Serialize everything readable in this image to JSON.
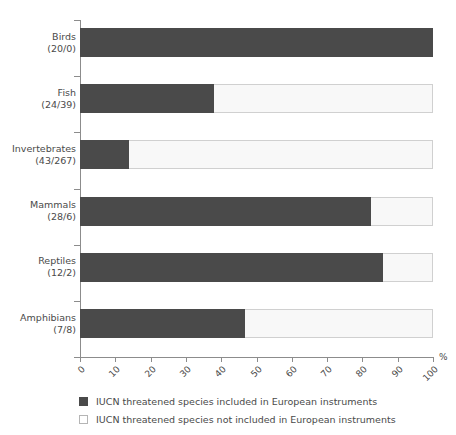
{
  "chart_data": {
    "type": "bar",
    "orientation": "horizontal",
    "stacked": true,
    "stack_mode": "percent",
    "title": "",
    "xlabel": "%",
    "ylabel": "",
    "xlim": [
      0,
      100
    ],
    "xticks": [
      "0",
      "10",
      "20",
      "30",
      "40",
      "50",
      "60",
      "70",
      "80",
      "90",
      "100"
    ],
    "grid": false,
    "legend_position": "bottom",
    "categories": [
      "Birds\n(20/0)",
      "Fish\n(24/39)",
      "Invertebrates\n(43/267)",
      "Mammals\n(28/6)",
      "Reptiles\n(12/2)",
      "Amphibians\n(7/8)"
    ],
    "category_names": [
      "Birds",
      "Fish",
      "Invertebrates",
      "Mammals",
      "Reptiles",
      "Amphibians"
    ],
    "category_counts": [
      "(20/0)",
      "(24/39)",
      "(43/267)",
      "(28/6)",
      "(12/2)",
      "(7/8)"
    ],
    "series": [
      {
        "name": "IUCN threatened species included in European instruments",
        "color": "#4a4a4a",
        "values": [
          100.0,
          38.1,
          13.9,
          82.4,
          85.7,
          46.7
        ]
      },
      {
        "name": "IUCN threatened species not included in European instruments",
        "color": "#f8f8f8",
        "values": [
          0.0,
          61.9,
          86.1,
          17.6,
          14.3,
          53.3
        ]
      }
    ]
  },
  "axis": {
    "unit_label": "%"
  },
  "legend": {
    "items": [
      {
        "label": "IUCN threatened species included in European instruments",
        "swatch": "dark"
      },
      {
        "label": "IUCN threatened species not included in European instruments",
        "swatch": "light"
      }
    ]
  }
}
